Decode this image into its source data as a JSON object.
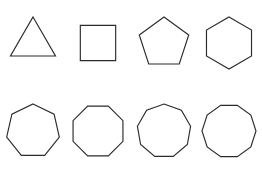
{
  "figure": {
    "background_color": "#ffffff",
    "stroke_color": "#2b2b2b",
    "fill": "none",
    "stroke_width": 1.15,
    "rows": 2,
    "columns": 4,
    "total_shapes": 8
  },
  "rows": [
    {
      "row_name": "top-row",
      "shapes": [
        {
          "name": "triangle",
          "sides": 3,
          "label": "Triangle",
          "radius": 26,
          "rotation_deg": -90,
          "orientation": "apex-up"
        },
        {
          "name": "square",
          "sides": 4,
          "label": "Square",
          "radius": 25,
          "rotation_deg": -45,
          "orientation": "axis-aligned"
        },
        {
          "name": "pentagon",
          "sides": 5,
          "label": "Pentagon",
          "radius": 26,
          "rotation_deg": -90,
          "orientation": "apex-up"
        },
        {
          "name": "hexagon",
          "sides": 6,
          "label": "Hexagon",
          "radius": 26,
          "rotation_deg": -90,
          "orientation": "pointy-top"
        }
      ]
    },
    {
      "row_name": "bottom-row",
      "shapes": [
        {
          "name": "heptagon",
          "sides": 7,
          "label": "Heptagon",
          "radius": 27,
          "rotation_deg": -90,
          "orientation": "apex-up"
        },
        {
          "name": "octagon",
          "sides": 8,
          "label": "Octagon",
          "radius": 27,
          "rotation_deg": -112.5,
          "orientation": "flat-top"
        },
        {
          "name": "nonagon",
          "sides": 9,
          "label": "Nonagon",
          "radius": 27,
          "rotation_deg": -90,
          "orientation": "apex-up"
        },
        {
          "name": "decagon",
          "sides": 10,
          "label": "Decagon",
          "radius": 27,
          "rotation_deg": -108,
          "orientation": "flat-top"
        }
      ]
    }
  ]
}
